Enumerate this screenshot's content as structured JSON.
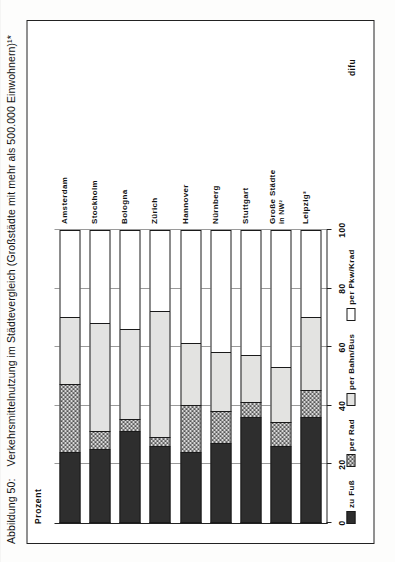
{
  "figure": {
    "caption_number": "Abbildung 50:",
    "caption_text": "Verkehrsmittelnutzung im Städtevergleich (Großstädte mit mehr als 500.000 Einwohnern)¹*",
    "source": "difu",
    "axis_label": "Prozent"
  },
  "legend": {
    "items": [
      {
        "label": "zu Fuß",
        "key": "fuss",
        "color": "#2e2e2e",
        "pattern": "solid-dark"
      },
      {
        "label": "per Rad",
        "key": "rad",
        "color": "#d8d8d8",
        "pattern": "cross-hatch"
      },
      {
        "label": "per Bahn/Bus",
        "key": "bahn",
        "color": "#e3e3e1",
        "pattern": "light-stipple"
      },
      {
        "label": "per Pkw/Krad",
        "key": "pkw",
        "color": "#ffffff",
        "pattern": "blank"
      }
    ]
  },
  "chart_data": {
    "type": "bar",
    "orientation": "horizontal-stacked",
    "title": "Verkehrsmittelnutzung im Städtevergleich (Großstädte mit mehr als 500.000 Einwohnern)¹*",
    "xlabel": "Prozent",
    "ylabel": "",
    "xlim": [
      0,
      100
    ],
    "xticks": [
      0,
      20,
      40,
      60,
      80,
      100
    ],
    "ticklabels": [
      "0",
      "20",
      "40",
      "60",
      "80",
      "100"
    ],
    "grid": true,
    "legend_position": "below-axis",
    "stacked_total": 100,
    "categories": [
      "Amsterdam",
      "Stockholm",
      "Bologna",
      "Zürich",
      "Hannover",
      "Nürnberg",
      "Stuttgart",
      "Große Städte in NW²",
      "Leipzig³"
    ],
    "series": [
      {
        "name": "zu Fuß",
        "values": [
          24,
          25,
          31,
          26,
          24,
          27,
          36,
          26,
          36
        ]
      },
      {
        "name": "per Rad",
        "values": [
          23,
          6,
          4,
          3,
          16,
          11,
          5,
          8,
          9
        ]
      },
      {
        "name": "per Bahn/Bus",
        "values": [
          23,
          37,
          31,
          43,
          21,
          20,
          16,
          19,
          25
        ]
      },
      {
        "name": "per Pkw/Krad",
        "values": [
          30,
          32,
          34,
          28,
          39,
          42,
          43,
          47,
          30
        ]
      }
    ]
  },
  "bars": [
    {
      "label": "Amsterdam",
      "sub": "",
      "fuss": 24,
      "rad": 23,
      "bahn": 23,
      "pkw": 30
    },
    {
      "label": "Stockholm",
      "sub": "",
      "fuss": 25,
      "rad": 6,
      "bahn": 37,
      "pkw": 32
    },
    {
      "label": "Bologna",
      "sub": "",
      "fuss": 31,
      "rad": 4,
      "bahn": 31,
      "pkw": 34
    },
    {
      "label": "Zürich",
      "sub": "",
      "fuss": 26,
      "rad": 3,
      "bahn": 43,
      "pkw": 28
    },
    {
      "label": "Hannover",
      "sub": "",
      "fuss": 24,
      "rad": 16,
      "bahn": 21,
      "pkw": 39
    },
    {
      "label": "Nürnberg",
      "sub": "",
      "fuss": 27,
      "rad": 11,
      "bahn": 20,
      "pkw": 42
    },
    {
      "label": "Stuttgart",
      "sub": "",
      "fuss": 36,
      "rad": 5,
      "bahn": 16,
      "pkw": 43
    },
    {
      "label": "Große Städte",
      "sub": "in NW²",
      "fuss": 26,
      "rad": 8,
      "bahn": 19,
      "pkw": 47
    },
    {
      "label": "Leipzig³",
      "sub": "",
      "fuss": 36,
      "rad": 9,
      "bahn": 25,
      "pkw": 30
    }
  ]
}
